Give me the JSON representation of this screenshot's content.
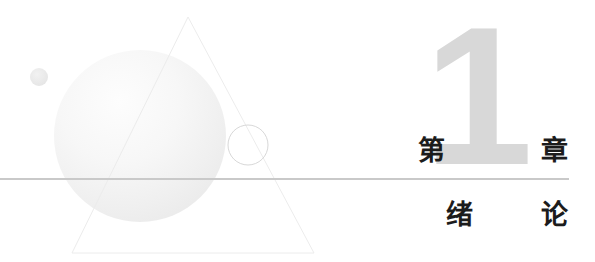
{
  "page": {
    "background_color": "#ffffff",
    "width": 595,
    "height": 262
  },
  "heading": {
    "chapter_prefix": "第",
    "chapter_number": "1",
    "chapter_suffix": "章",
    "ghost_number": "1",
    "ghost_number_color": "#d8d8d8",
    "text_color": "#1c1c1c",
    "rule_color": "#c9c9c9"
  },
  "subject": {
    "char_1": "绪",
    "char_2": "论"
  },
  "decor": {
    "sphere": {
      "name": "gradient-sphere",
      "cx": 140,
      "cy": 136,
      "r": 86,
      "color_light": "#fcfcfc",
      "color_dark": "#eeeeee"
    },
    "small_dot": {
      "name": "small-dot",
      "cx": 39,
      "cy": 77,
      "r": 9,
      "color": "#ececec"
    },
    "triangle": {
      "name": "triangle-outline",
      "apex_x": 188,
      "apex_y": 17,
      "base_left_x": 72,
      "base_right_x": 314,
      "base_y": 253,
      "stroke": "#ededed"
    },
    "ring": {
      "name": "ring-outline",
      "cx": 248,
      "cy": 145,
      "r": 20,
      "stroke": "#d6d6d6"
    }
  }
}
